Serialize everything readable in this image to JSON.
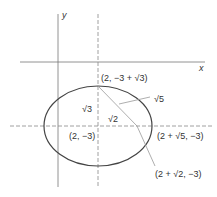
{
  "diagram": {
    "type": "ellipse-foci",
    "axes": {
      "x_label": "x",
      "y_label": "y"
    },
    "center_label": "(2, −3)",
    "top_vertex_label": "(2, −3 + √3)",
    "right_vertex_label": "(2 + √5, −3)",
    "focus_label": "(2 + √2, −3)",
    "semi_minor_label": "√3",
    "semi_major_label": "√5",
    "focal_distance_label": "√2",
    "colors": {
      "ellipse": "#444444",
      "axes": "#777777",
      "dashed": "#888888",
      "segments": "#999999"
    }
  }
}
